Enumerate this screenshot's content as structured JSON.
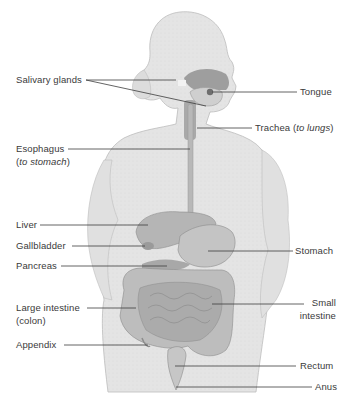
{
  "diagram": {
    "colors": {
      "background": "#ffffff",
      "silhouette": "#e4e4e4",
      "silhouette_outline": "#bdbdbd",
      "organ_fill": "#c9c9c9",
      "organ_dark": "#a8a8a8",
      "leader_line": "#3c3c3c",
      "label_text": "#3a3a3a"
    },
    "labels": {
      "salivary_glands": "Salivary glands",
      "tongue": "Tongue",
      "trachea": "Trachea (",
      "trachea_italic": "to lungs",
      "trachea_close": ")",
      "esophagus": "Esophagus",
      "esophagus_sub_open": "(",
      "esophagus_sub_italic": "to stomach",
      "esophagus_sub_close": ")",
      "liver": "Liver",
      "gallbladder": "Gallbladder",
      "pancreas": "Pancreas",
      "stomach": "Stomach",
      "large_intestine": "Large intestine",
      "large_intestine_sub": "(colon)",
      "small_intestine_line1": "Small",
      "small_intestine_line2": "intestine",
      "appendix": "Appendix",
      "rectum": "Rectum",
      "anus": "Anus"
    }
  }
}
